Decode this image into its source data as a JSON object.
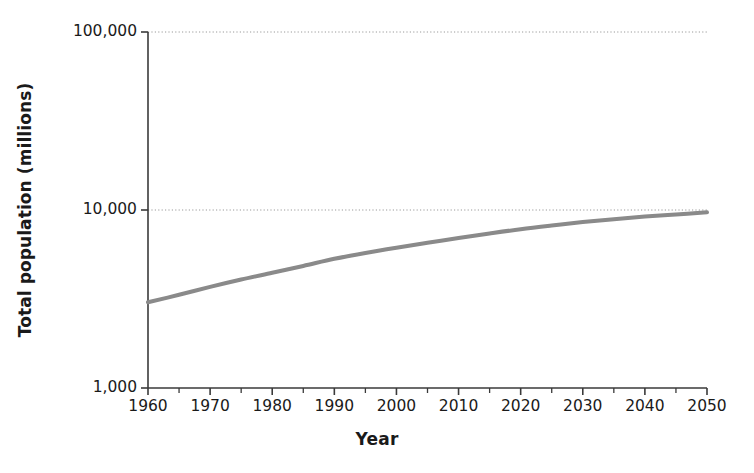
{
  "chart_data": {
    "type": "line",
    "title": "",
    "xlabel": "Year",
    "ylabel": "Total population (millions)",
    "yscale": "log",
    "ylim": [
      1000,
      100000
    ],
    "xlim": [
      1960,
      2050
    ],
    "grid": "horizontal-dotted",
    "legend": "none",
    "y_tick_labels": [
      "100,000",
      "10,000",
      "1,000"
    ],
    "y_tick_values": [
      100000,
      10000,
      1000
    ],
    "x_tick_labels": [
      "1960",
      "1970",
      "1980",
      "1990",
      "2000",
      "2010",
      "2020",
      "2030",
      "2040",
      "2050"
    ],
    "x_tick_values": [
      1960,
      1970,
      1980,
      1990,
      2000,
      2010,
      2020,
      2030,
      2040,
      2050
    ],
    "x_minor_tick_values": [
      1965,
      1975,
      1985,
      1995,
      2005,
      2015,
      2025,
      2035,
      2045
    ],
    "series": [
      {
        "name": "World total population",
        "color": "#8a8a8a",
        "line_width": 4,
        "x": [
          1960,
          1965,
          1970,
          1975,
          1980,
          1985,
          1990,
          1995,
          2000,
          2005,
          2010,
          2015,
          2020,
          2025,
          2030,
          2035,
          2040,
          2045,
          2050
        ],
        "values": [
          3030,
          3340,
          3700,
          4070,
          4440,
          4850,
          5320,
          5740,
          6140,
          6540,
          6960,
          7380,
          7800,
          8180,
          8550,
          8880,
          9180,
          9440,
          9700
        ]
      }
    ]
  },
  "axes": {
    "y_axis_label": "Total population (millions)",
    "x_axis_label": "Year"
  }
}
